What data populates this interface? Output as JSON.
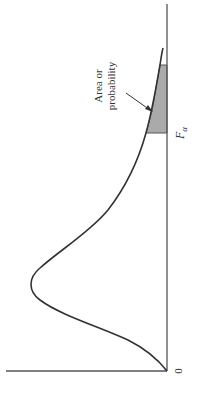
{
  "diagram": {
    "type": "F-distribution density curve (rotated 90°)",
    "annotation_line1": "Area or",
    "annotation_line2": "probability",
    "critical_value_label": "F",
    "critical_value_subscript": "α",
    "origin_label": "0",
    "colors": {
      "curve": "#333333",
      "axis": "#555555",
      "shaded_area": "#aaaaaa",
      "text": "#333333"
    }
  }
}
